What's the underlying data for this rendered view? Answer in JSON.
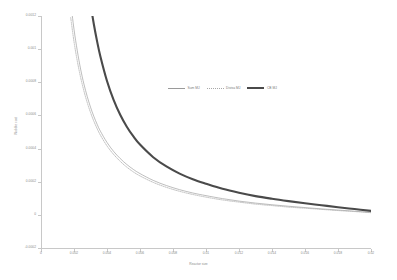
{
  "chart_data": {
    "type": "line",
    "title": "",
    "xlabel": "Reactor size",
    "ylabel": "Wobble cost",
    "xlim": [
      0,
      0.02
    ],
    "ylim": [
      -0.0002,
      0.0012
    ],
    "grid": false,
    "legend_position": "upper-center",
    "x_ticks": [
      "0",
      "0.002",
      "0.004",
      "0.006",
      "0.008",
      "0.01",
      "0.012",
      "0.014",
      "0.016",
      "0.018",
      "0.02"
    ],
    "x_tick_values": [
      0,
      0.002,
      0.004,
      0.006,
      0.008,
      0.01,
      0.012,
      0.014,
      0.016,
      0.018,
      0.02
    ],
    "y_ticks": [
      "0.0012",
      "0.001",
      "0.0008",
      "0.0006",
      "0.0004",
      "0.0002",
      "0",
      "-0.0002"
    ],
    "y_tick_values": [
      0.0012,
      0.001,
      0.0008,
      0.0006,
      0.0004,
      0.0002,
      0,
      -0.0002
    ],
    "x": [
      0.0018,
      0.002,
      0.0022,
      0.0024,
      0.0026,
      0.0028,
      0.003,
      0.0032,
      0.0034,
      0.0036,
      0.004,
      0.0044,
      0.0048,
      0.0052,
      0.0056,
      0.006,
      0.0068,
      0.0076,
      0.0084,
      0.0092,
      0.01,
      0.011,
      0.012,
      0.013,
      0.014,
      0.015,
      0.016,
      0.017,
      0.018,
      0.019,
      0.02
    ],
    "series": [
      {
        "name": "Sum MJ",
        "style": "solid-thin",
        "color": "#9a9a9a",
        "values": [
          0.00128,
          0.00112,
          0.00099,
          0.00088,
          0.00079,
          0.000715,
          0.00065,
          0.000595,
          0.000547,
          0.000505,
          0.000437,
          0.000383,
          0.00034,
          0.000304,
          0.000274,
          0.000249,
          0.000208,
          0.000177,
          0.000152,
          0.000132,
          0.000116,
          9.8e-05,
          8.3e-05,
          7.1e-05,
          6.1e-05,
          5.2e-05,
          4.4e-05,
          3.6e-05,
          2.9e-05,
          2.2e-05,
          1.5e-05
        ]
      },
      {
        "name": "Divisa MJ",
        "style": "dotted",
        "color": "#a8a8a8",
        "values": [
          0.00119,
          0.001045,
          0.000928,
          0.00083,
          0.000748,
          0.000678,
          0.000618,
          0.000566,
          0.000521,
          0.000481,
          0.000416,
          0.000365,
          0.000323,
          0.000288,
          0.000259,
          0.000235,
          0.000196,
          0.000166,
          0.000142,
          0.000123,
          0.000107,
          9e-05,
          7.7e-05,
          6.5e-05,
          5.6e-05,
          4.7e-05,
          4e-05,
          3.3e-05,
          2.6e-05,
          2e-05,
          1.3e-05
        ]
      },
      {
        "name": "CB MJ",
        "style": "solid-thick",
        "color": "#4a4a4a",
        "values": [
          0.00272,
          0.00234,
          0.00204,
          0.00179,
          0.00159,
          0.00142,
          0.001275,
          0.001152,
          0.001047,
          0.000956,
          0.000808,
          0.000694,
          0.000604,
          0.000532,
          0.000473,
          0.000424,
          0.000348,
          0.000292,
          0.000249,
          0.000215,
          0.000188,
          0.000157,
          0.000133,
          0.000113,
          9.7e-05,
          8.3e-05,
          7e-05,
          5.8e-05,
          4.6e-05,
          3.5e-05,
          2.4e-05
        ]
      }
    ]
  }
}
